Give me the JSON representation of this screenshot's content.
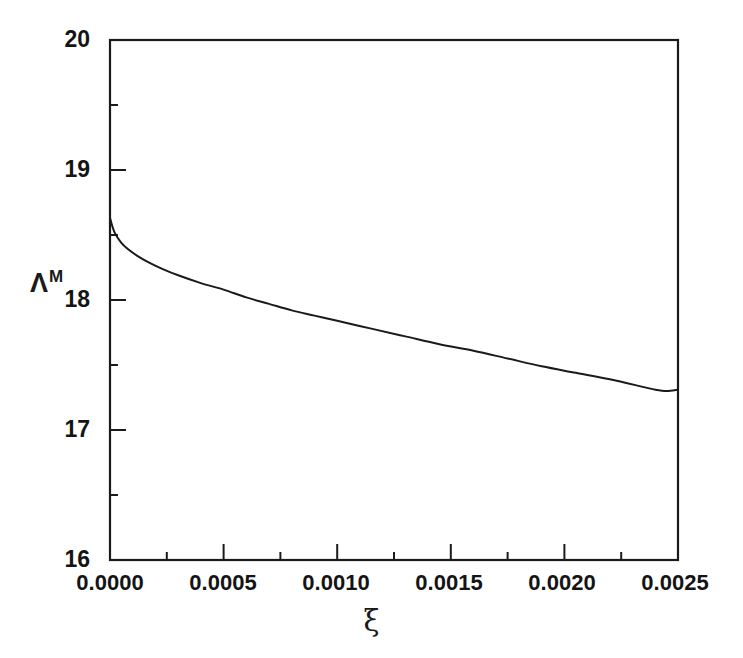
{
  "chart_data": {
    "type": "line",
    "title": "",
    "subtitle": "",
    "xlabel": "ξ",
    "ylabel": "ΛM",
    "ylabel_base": "Λ",
    "ylabel_superscript": "M",
    "xlim": [
      0.0,
      0.0025
    ],
    "ylim": [
      16,
      20
    ],
    "xticks": [
      0.0,
      0.0005,
      0.001,
      0.0015,
      0.002,
      0.0025
    ],
    "xtick_labels": [
      "0.0000",
      "0.0005",
      "0.0010",
      "0.0015",
      "0.0020",
      "0.0025"
    ],
    "yticks": [
      16,
      17,
      18,
      19,
      20
    ],
    "ytick_labels": [
      "16",
      "17",
      "18",
      "19",
      "20"
    ],
    "x_minor_ticks": [
      0.00025,
      0.00075,
      0.00125,
      0.00175,
      0.00225
    ],
    "y_minor_ticks": [
      16.5,
      17.5,
      18.5,
      19.5
    ],
    "grid": false,
    "legend": false,
    "legend_position": "none",
    "line_color": "#1a1a1a",
    "line_width": 2,
    "frame_color": "#1a1a1a",
    "background": "#ffffff",
    "series": [
      {
        "name": "ΛM vs ξ",
        "x": [
          0.0,
          2e-05,
          5e-05,
          8e-05,
          0.00012,
          0.00017,
          0.00023,
          0.0003,
          0.0004,
          0.0005,
          0.0006,
          0.0007,
          0.0008,
          0.0009,
          0.001,
          0.00115,
          0.0013,
          0.00145,
          0.0016,
          0.00175,
          0.0019,
          0.00205,
          0.0022,
          0.00235,
          0.0024,
          0.00245,
          0.0025
        ],
        "y": [
          18.63,
          18.52,
          18.44,
          18.39,
          18.34,
          18.29,
          18.24,
          18.19,
          18.13,
          18.08,
          18.02,
          17.97,
          17.92,
          17.88,
          17.84,
          17.78,
          17.72,
          17.66,
          17.61,
          17.55,
          17.49,
          17.44,
          17.39,
          17.33,
          17.31,
          17.3,
          17.31
        ]
      }
    ]
  },
  "ytick_labels_list": [
    "20",
    "19",
    "18",
    "17",
    "16"
  ],
  "xtick_labels_list": [
    "0.0000",
    "0.0005",
    "0.0010",
    "0.0015",
    "0.0020",
    "0.0025"
  ],
  "labels": {
    "y_axis_base": "Λ",
    "y_axis_sup": "M",
    "x_axis": "ξ"
  }
}
